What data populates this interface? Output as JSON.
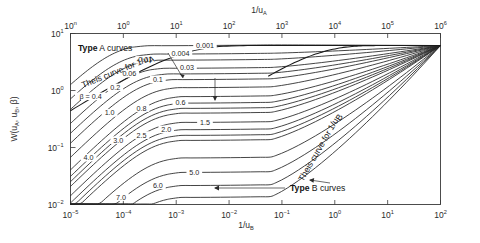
{
  "chart_data": {
    "type": "line",
    "title": "",
    "subtitle": "",
    "xlabel_bottom": "1/uB",
    "xlabel_top": "1/uA",
    "ylabel": "W(uA, uB, β)",
    "xlim_bottom": [
      1e-05,
      100
    ],
    "xlim_top": [
      0.1,
      1000000
    ],
    "ylim": [
      0.01,
      10
    ],
    "xscale": "log",
    "yscale": "log",
    "grid": false,
    "legend_position": "none",
    "xticks_bottom": [
      {
        "label": "10",
        "exp": "−5"
      },
      {
        "label": "10",
        "exp": "−4"
      },
      {
        "label": "10",
        "exp": "−3"
      },
      {
        "label": "10",
        "exp": "−2"
      },
      {
        "label": "10",
        "exp": "−1"
      },
      {
        "label": "10",
        "exp": "0"
      },
      {
        "label": "10",
        "exp": "1"
      },
      {
        "label": "10",
        "exp": "2"
      }
    ],
    "xticks_top": [
      {
        "label": "10",
        "exp": "n"
      },
      {
        "label": "10",
        "exp": "0"
      },
      {
        "label": "10",
        "exp": "1"
      },
      {
        "label": "10",
        "exp": "2"
      },
      {
        "label": "10",
        "exp": "3"
      },
      {
        "label": "10",
        "exp": "4"
      },
      {
        "label": "10",
        "exp": "5"
      },
      {
        "label": "10",
        "exp": "6"
      }
    ],
    "yticks": [
      {
        "label": "10",
        "exp": "1"
      },
      {
        "label": "10",
        "exp": "0"
      },
      {
        "label": "10",
        "exp": "−1"
      },
      {
        "label": "10",
        "exp": "−2"
      }
    ],
    "series": [
      {
        "name": "β = 0.001",
        "beta": 0.001,
        "plateau": 6.1,
        "label": "0.001"
      },
      {
        "name": "β = 0.004",
        "beta": 0.004,
        "plateau": 4.35,
        "label": "0.004"
      },
      {
        "name": "β = 0.01",
        "beta": 0.01,
        "plateau": 3.4,
        "label": "0.01"
      },
      {
        "name": "β = 0.03",
        "beta": 0.03,
        "plateau": 2.45,
        "label": "0.03"
      },
      {
        "name": "β = 0.06",
        "beta": 0.06,
        "plateau": 1.95,
        "label": "0.06"
      },
      {
        "name": "β = 0.1",
        "beta": 0.1,
        "plateau": 1.55,
        "label": "0.1"
      },
      {
        "name": "β = 0.2",
        "beta": 0.2,
        "plateau": 1.12,
        "label": "0.2"
      },
      {
        "name": "β = 0.4",
        "beta": 0.4,
        "plateau": 0.78,
        "label": "β = 0.4"
      },
      {
        "name": "β = 0.6",
        "beta": 0.6,
        "plateau": 0.6,
        "label": "0.6"
      },
      {
        "name": "β = 0.8",
        "beta": 0.8,
        "plateau": 0.485,
        "label": "0.8"
      },
      {
        "name": "β = 1.0",
        "beta": 1.0,
        "plateau": 0.4,
        "label": "1.0"
      },
      {
        "name": "β = 1.5",
        "beta": 1.5,
        "plateau": 0.275,
        "label": "1.5"
      },
      {
        "name": "β = 2.0",
        "beta": 2.0,
        "plateau": 0.205,
        "label": "2.0"
      },
      {
        "name": "β = 2.5",
        "beta": 2.5,
        "plateau": 0.163,
        "label": "2.5"
      },
      {
        "name": "β = 3.0",
        "beta": 3.0,
        "plateau": 0.133,
        "label": "3.0"
      },
      {
        "name": "β = 4.0",
        "beta": 4.0,
        "plateau": 0.0655,
        "label": "4.0"
      },
      {
        "name": "β = 5.0",
        "beta": 5.0,
        "plateau": 0.0365,
        "label": "5.0"
      },
      {
        "name": "β = 6.0",
        "beta": 6.0,
        "plateau": 0.0215,
        "label": "6.0"
      },
      {
        "name": "β = 7.0",
        "beta": 7.0,
        "plateau": 0.0133,
        "label": "7.0"
      }
    ],
    "annotations": [
      {
        "name": "type-a-curves",
        "text_bold": "Type",
        "text_rest": " A curves"
      },
      {
        "name": "type-b-curves",
        "text_bold": "Type",
        "text_rest": " B curves"
      },
      {
        "name": "theis-a",
        "text": "Theis curve for 1/uA"
      },
      {
        "name": "theis-b",
        "text": "Theis curve for 1/uB"
      }
    ]
  },
  "labels": {
    "type_a_bold": "Type",
    "type_a_rest": " A curves",
    "type_b_bold": "Type",
    "type_b_rest": " B curves",
    "theis_a_pre": "Theis  curve  for  1/u",
    "theis_a_sub": "A",
    "theis_b_pre": "Theis  curve  for  1/u",
    "theis_b_sub": "B",
    "ylabel_pre": "W(u",
    "ylabel_sub1": "A",
    "ylabel_mid": ", u",
    "ylabel_sub2": "B",
    "ylabel_post": ", β)",
    "xlabel_bottom_pre": "1/u",
    "xlabel_bottom_sub": "B",
    "xlabel_top_pre": "1/u",
    "xlabel_top_sub": "A"
  },
  "colors": {
    "curve": "#242424",
    "frame": "#3a3a3a",
    "text": "#1a1a1a",
    "background": "#ffffff"
  }
}
